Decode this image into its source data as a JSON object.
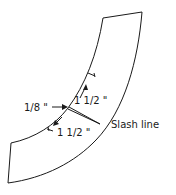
{
  "diagram": {
    "type": "pattern-piece",
    "labels": {
      "seam_allowance": "1/8 \"",
      "upper_measure": "1 1/2 \"",
      "lower_measure": "1 1/2 \"",
      "slash_line": "Slash line"
    },
    "colors": {
      "line": "#1a1a1a",
      "background": "#ffffff"
    }
  }
}
